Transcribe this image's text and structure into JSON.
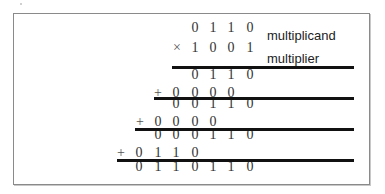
{
  "diagram": {
    "labels": {
      "multiplicand": "multiplicand",
      "multiplier": "multiplier"
    },
    "operators": {
      "times": "×",
      "plus": "+"
    },
    "rows": [
      {
        "role": "multiplicand",
        "digits": [
          "0",
          "1",
          "1",
          "0"
        ],
        "start_col": 3
      },
      {
        "role": "multiplier",
        "digits": [
          "1",
          "0",
          "0",
          "1"
        ],
        "start_col": 3,
        "operator": "×"
      },
      {
        "role": "partial-product-1",
        "digits": [
          "0",
          "1",
          "1",
          "0"
        ],
        "start_col": 3
      },
      {
        "role": "partial-product-2",
        "digits": [
          "0",
          "0",
          "0",
          "0"
        ],
        "start_col": 2,
        "operator": "+"
      },
      {
        "role": "running-sum-1",
        "digits": [
          "0",
          "0",
          "1",
          "1",
          "0"
        ],
        "start_col": 2
      },
      {
        "role": "partial-product-3",
        "digits": [
          "0",
          "0",
          "0",
          "0"
        ],
        "start_col": 1,
        "operator": "+"
      },
      {
        "role": "running-sum-2",
        "digits": [
          "0",
          "0",
          "0",
          "1",
          "1",
          "0"
        ],
        "start_col": 1
      },
      {
        "role": "partial-product-4",
        "digits": [
          "0",
          "1",
          "1",
          "0"
        ],
        "start_col": 0,
        "operator": "+"
      },
      {
        "role": "product",
        "digits": [
          "0",
          "1",
          "1",
          "0",
          "1",
          "1",
          "0"
        ],
        "start_col": 0
      }
    ]
  }
}
